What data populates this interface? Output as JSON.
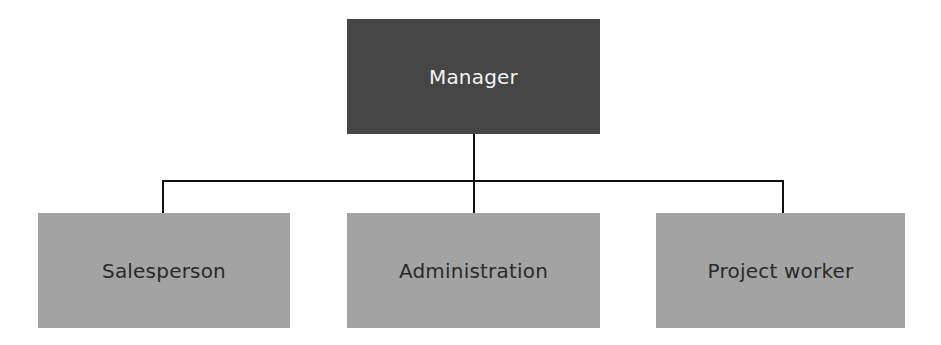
{
  "diagram": {
    "type": "org-chart",
    "root": {
      "label": "Manager",
      "color": "#454545",
      "text_color": "#f2f2f2"
    },
    "children": [
      {
        "label": "Salesperson"
      },
      {
        "label": "Administration"
      },
      {
        "label": "Project worker"
      }
    ],
    "child_color": "#a3a3a3",
    "child_text_color": "#2a2a2a",
    "connector_color": "#111111"
  }
}
